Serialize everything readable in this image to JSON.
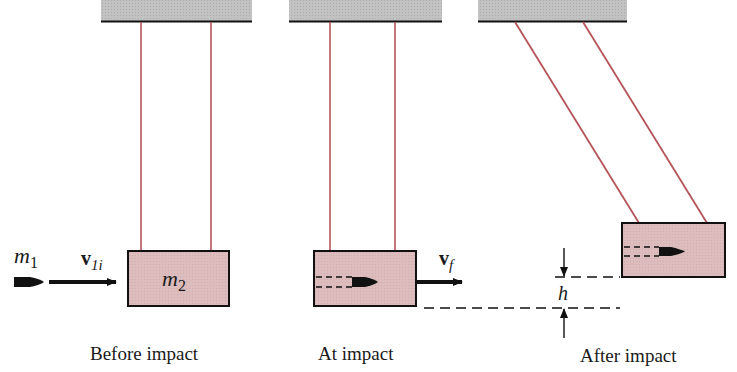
{
  "figure": {
    "panels": [
      {
        "id": "before",
        "caption": "Before impact"
      },
      {
        "id": "at",
        "caption": "At impact"
      },
      {
        "id": "after",
        "caption": "After impact"
      }
    ],
    "labels": {
      "bullet_mass": "m",
      "bullet_mass_sub": "1",
      "block_mass": "m",
      "block_mass_sub": "2",
      "initial_velocity": "v",
      "initial_velocity_sub": "1i",
      "final_velocity": "v",
      "final_velocity_sub": "f",
      "height": "h"
    },
    "colors": {
      "ceiling": "#bdbdbd",
      "string": "#b5545a",
      "block_fill": "#dcbcbc",
      "outline": "#111111"
    }
  }
}
